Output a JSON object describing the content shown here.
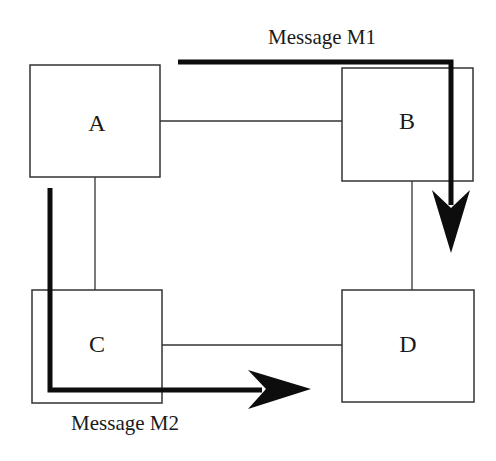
{
  "diagram": {
    "nodes": [
      {
        "id": "A",
        "label": "A"
      },
      {
        "id": "B",
        "label": "B"
      },
      {
        "id": "C",
        "label": "C"
      },
      {
        "id": "D",
        "label": "D"
      }
    ],
    "links": [
      {
        "from": "A",
        "to": "B"
      },
      {
        "from": "A",
        "to": "C"
      },
      {
        "from": "B",
        "to": "D"
      },
      {
        "from": "C",
        "to": "D"
      }
    ],
    "messages": [
      {
        "id": "M1",
        "label": "Message M1",
        "path": [
          "A",
          "B",
          "D"
        ]
      },
      {
        "id": "M2",
        "label": "Message M2",
        "path": [
          "A",
          "C",
          "D"
        ]
      }
    ],
    "colors": {
      "stroke": "#1a1a1a",
      "background": "#ffffff"
    }
  }
}
